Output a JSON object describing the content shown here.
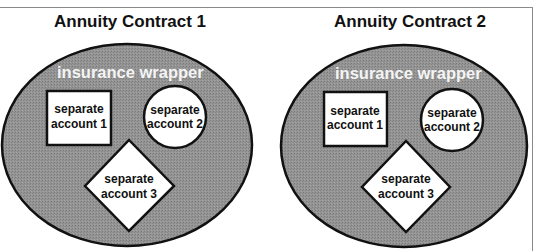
{
  "figure": {
    "cropped_caption_fragment": "",
    "contracts": [
      {
        "title": "Annuity Contract 1",
        "wrapper_label": "insurance wrapper",
        "accounts": [
          {
            "shape": "square",
            "line1": "separate",
            "line2": "account 1"
          },
          {
            "shape": "circle",
            "line1": "separate",
            "line2": "account 2"
          },
          {
            "shape": "diamond",
            "line1": "separate",
            "line2": "account 3"
          }
        ]
      },
      {
        "title": "Annuity Contract 2",
        "wrapper_label": "insurance wrapper",
        "accounts": [
          {
            "shape": "square",
            "line1": "separate",
            "line2": "account 1"
          },
          {
            "shape": "circle",
            "line1": "separate",
            "line2": "account 2"
          },
          {
            "shape": "diamond",
            "line1": "separate",
            "line2": "account 3"
          }
        ]
      }
    ]
  },
  "colors": {
    "wrapper_fill": "#8e8e8e",
    "outline": "#111111",
    "account_fill": "#ffffff",
    "frame": "#8a8a8a"
  }
}
